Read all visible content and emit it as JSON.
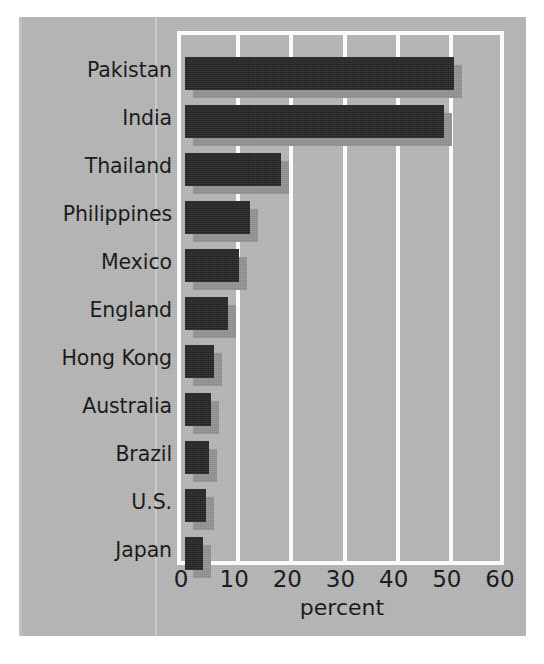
{
  "chart_data": {
    "type": "bar",
    "orientation": "horizontal",
    "title": "",
    "subtitle": "",
    "xlabel": "percent",
    "ylabel": "",
    "xlim": [
      0,
      60
    ],
    "ylim": null,
    "grid": true,
    "legend": null,
    "legend_position": "none",
    "xticks": [
      "0",
      "10",
      "20",
      "30",
      "40",
      "50",
      "60"
    ],
    "xtick_values": [
      0,
      10,
      20,
      30,
      40,
      50,
      60
    ],
    "categories": [
      "Pakistan",
      "India",
      "Thailand",
      "Philippines",
      "Mexico",
      "England",
      "Hong Kong",
      "Australia",
      "Brazil",
      "U.S.",
      "Japan"
    ],
    "values": [
      50.6,
      48.8,
      18.1,
      12.3,
      10.1,
      8.0,
      5.4,
      4.8,
      4.5,
      3.9,
      3.4
    ],
    "series": [
      {
        "name": "percent",
        "values": [
          50.6,
          48.8,
          18.1,
          12.3,
          10.1,
          8.0,
          5.4,
          4.8,
          4.5,
          3.9,
          3.4
        ]
      }
    ],
    "annotations": []
  },
  "style": {
    "background_color": "#b3b3b3",
    "page_color": "#ffffff",
    "bar_color": "#232323",
    "bar_shadow_color": "#8f8f8f",
    "grid_color": "#ffffff",
    "text_color": "#111111"
  }
}
